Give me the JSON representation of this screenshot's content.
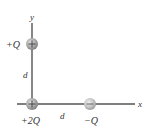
{
  "diagram": {
    "type": "point-charge configuration",
    "axes": {
      "x_label": "x",
      "y_label": "y"
    },
    "distance_labels": {
      "vertical": "d",
      "horizontal": "d"
    },
    "charges": [
      {
        "id": "top",
        "label": "+Q",
        "sign": "+",
        "position": "(0, d)"
      },
      {
        "id": "origin",
        "label": "+2Q",
        "sign": "+",
        "position": "(0, 0)"
      },
      {
        "id": "right",
        "label": "−Q",
        "sign": "−",
        "position": "(d, 0)"
      }
    ],
    "colors": {
      "axis": "#555555",
      "charge_fill": "#9a9a9a",
      "charge_highlight": "#dcdcdc",
      "text": "#333333"
    }
  }
}
